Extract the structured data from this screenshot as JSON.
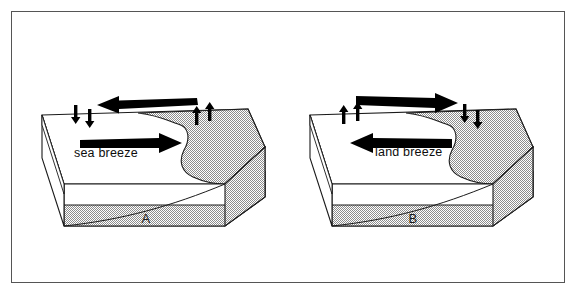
{
  "figure": {
    "type": "diagram",
    "frame_color": "#555555",
    "background_color": "#ffffff",
    "land_fill_color": "#c8c8c8",
    "water_fill_color": "#ffffff",
    "arrow_color": "#000000",
    "panels": [
      {
        "id": "A",
        "caption": "A",
        "breeze_label": "sea breeze",
        "upper_arrow_direction": "left",
        "lower_arrow_direction": "right",
        "left_vertical_arrows_direction": "down",
        "left_vertical_arrow_count": 2,
        "right_vertical_arrows_direction": "up",
        "right_vertical_arrow_count": 2
      },
      {
        "id": "B",
        "caption": "B",
        "breeze_label": "land breeze",
        "upper_arrow_direction": "right",
        "lower_arrow_direction": "left",
        "left_vertical_arrows_direction": "up",
        "left_vertical_arrow_count": 2,
        "right_vertical_arrows_direction": "down",
        "right_vertical_arrow_count": 2
      }
    ]
  }
}
